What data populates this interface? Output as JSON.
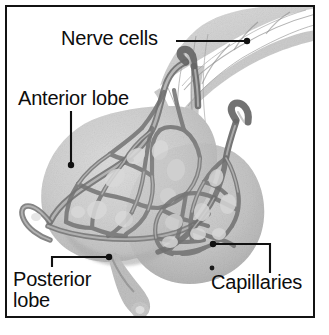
{
  "figure": {
    "border_color": "#131313",
    "background_color": "#ffffff",
    "width": 329,
    "height": 335
  },
  "labels": {
    "nerve_cells": "Nerve cells",
    "anterior_lobe": "Anterior lobe",
    "posterior_lobe_line1": "Posterior",
    "posterior_lobe_line2": "lobe",
    "capillaries": "Capillaries"
  },
  "leaders": {
    "nerve_cells": {
      "type": "straight-horizontal",
      "from_x": 176,
      "from_y": 41,
      "to_x": 248,
      "to_y": 41,
      "dot_at": "end"
    },
    "anterior_lobe": {
      "type": "straight-vertical",
      "from_x": 71,
      "from_y": 111,
      "to_x": 71,
      "to_y": 166,
      "dot_at": "end"
    },
    "posterior_lobe": {
      "type": "elbow",
      "from_x": 52,
      "from_y": 266,
      "corner_x": 52,
      "corner_y": 257,
      "to_x": 110,
      "to_y": 257,
      "dot_at": "end"
    },
    "capillaries": {
      "type": "elbow",
      "from_x": 270,
      "from_y": 272,
      "corner_x": 270,
      "corner_y": 244,
      "to_x": 213,
      "to_y": 244,
      "dot_at": "end"
    }
  },
  "illustration": {
    "description": "Grayscale micrograph-style drawing of a pituitary gland showing the anterior lobe as a large pale rounded mass at left, the posterior lobe at lower right, a nerve fiber stalk entering from upper right, and a dark branching capillary network threading through both lobes.",
    "parts": [
      {
        "name": "nerve-fiber-stalk",
        "tone": "#cfcfcf"
      },
      {
        "name": "anterior-lobe-mass",
        "tone": "#d6d6d6"
      },
      {
        "name": "posterior-lobe-mass",
        "tone": "#cdcdcd"
      },
      {
        "name": "capillary-network",
        "tone": "#7d7d7d"
      },
      {
        "name": "posterior-lobe-tail",
        "tone": "#b5b5b5"
      }
    ],
    "colors": {
      "lobe_light": "#dcdcdc",
      "lobe_mid": "#c9c9c9",
      "lobe_shadow": "#b3b3b3",
      "capillary_dark": "#6f6f6f",
      "capillary_mid": "#8d8d8d",
      "stalk": "#d2d2d2"
    }
  },
  "artifacts": {
    "speck_near_capillaries": {
      "x": 212,
      "y": 268,
      "r": 2.4
    }
  }
}
